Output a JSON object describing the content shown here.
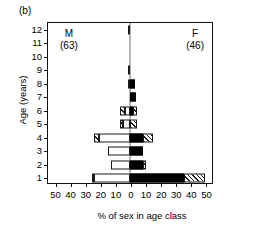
{
  "figure": {
    "panel_label": "(b)"
  },
  "annotations": {
    "male": {
      "symbol": "M",
      "count": "(63)"
    },
    "female": {
      "symbol": "F",
      "count": "(46)"
    }
  },
  "axes": {
    "y": {
      "title": "Age (years)",
      "ticks": [
        1,
        2,
        3,
        4,
        5,
        6,
        7,
        8,
        9,
        10,
        11,
        12
      ],
      "min": 0.5,
      "max": 12.5
    },
    "x": {
      "title": "% of sex in age class",
      "tick_labels": [
        "50",
        "40",
        "30",
        "20",
        "10",
        "0",
        "10",
        "20",
        "30",
        "40",
        "50"
      ],
      "tick_values": [
        -50,
        -40,
        -30,
        -20,
        -10,
        0,
        10,
        20,
        30,
        40,
        50
      ],
      "min": -55,
      "max": 55
    }
  },
  "chart_data": {
    "type": "bar",
    "subtype": "population-pyramid",
    "title": "",
    "xlabel": "% of sex in age class",
    "ylabel": "Age (years)",
    "xlim": [
      -55,
      55
    ],
    "ylim": [
      0.5,
      12.5
    ],
    "grid": false,
    "legend": "none",
    "orientation": "horizontal",
    "groups": [
      {
        "name": "Male",
        "symbol": "M",
        "n": 63,
        "side": "left"
      },
      {
        "name": "Female",
        "symbol": "F",
        "n": 46,
        "side": "right"
      }
    ],
    "fill_patterns": {
      "male_main": "hollow",
      "male_outer": "hatch",
      "female_main": "solid",
      "female_outer": "hatch"
    },
    "categories": [
      12,
      11,
      10,
      9,
      8,
      7,
      6,
      5,
      4,
      3,
      2,
      1
    ],
    "rows": [
      {
        "age": 12,
        "male": {
          "main": 1.6,
          "outer": 0.0,
          "total": 1.6
        },
        "female": {
          "main": 0.0,
          "outer": 0.0,
          "total": 0.0
        }
      },
      {
        "age": 11,
        "male": {
          "main": 0.0,
          "outer": 0.0,
          "total": 0.0
        },
        "female": {
          "main": 0.0,
          "outer": 0.0,
          "total": 0.0
        }
      },
      {
        "age": 10,
        "male": {
          "main": 0.0,
          "outer": 0.0,
          "total": 0.0
        },
        "female": {
          "main": 0.0,
          "outer": 0.0,
          "total": 0.0
        }
      },
      {
        "age": 9,
        "male": {
          "main": 0.0,
          "outer": 1.6,
          "total": 1.6
        },
        "female": {
          "main": 0.0,
          "outer": 0.0,
          "total": 0.0
        }
      },
      {
        "age": 8,
        "male": {
          "main": 0.0,
          "outer": 1.6,
          "total": 1.6
        },
        "female": {
          "main": 3.0,
          "outer": 0.0,
          "total": 3.0
        }
      },
      {
        "age": 7,
        "male": {
          "main": 0.0,
          "outer": 0.0,
          "total": 0.0
        },
        "female": {
          "main": 4.3,
          "outer": 0.0,
          "total": 4.3
        }
      },
      {
        "age": 6,
        "male": {
          "main": 3.2,
          "outer": 3.2,
          "total": 6.4
        },
        "female": {
          "main": 2.2,
          "outer": 2.2,
          "total": 4.4
        }
      },
      {
        "age": 5,
        "male": {
          "main": 4.8,
          "outer": 1.6,
          "total": 6.4
        },
        "female": {
          "main": 0.0,
          "outer": 4.4,
          "total": 4.4
        }
      },
      {
        "age": 4,
        "male": {
          "main": 20.6,
          "outer": 3.2,
          "total": 23.8
        },
        "female": {
          "main": 8.7,
          "outer": 6.5,
          "total": 15.2
        }
      },
      {
        "age": 3,
        "male": {
          "main": 14.3,
          "outer": 0.0,
          "total": 14.3
        },
        "female": {
          "main": 8.7,
          "outer": 0.0,
          "total": 8.7
        }
      },
      {
        "age": 2,
        "male": {
          "main": 12.7,
          "outer": 0.0,
          "total": 12.7
        },
        "female": {
          "main": 8.7,
          "outer": 2.2,
          "total": 10.9
        }
      },
      {
        "age": 1,
        "male": {
          "main": 23.8,
          "outer": 1.6,
          "total": 25.4
        },
        "female": {
          "main": 36.0,
          "outer": 14.0,
          "total": 50.0
        }
      }
    ]
  }
}
